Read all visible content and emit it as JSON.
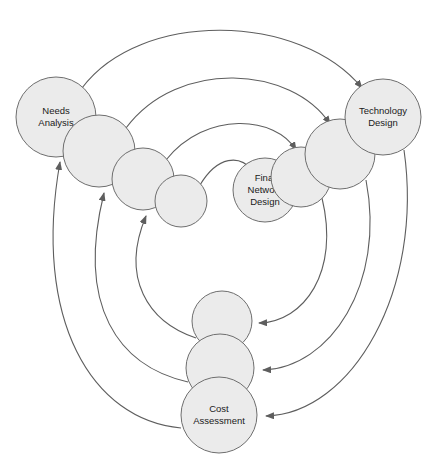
{
  "diagram": {
    "type": "cyclic-process-diagram",
    "background_color": "#ffffff",
    "node_fill_color": "#ebebeb",
    "node_stroke_color": "#6e6e6e",
    "arc_stroke_color": "#5e5e5e",
    "label_color": "#1a1a1a",
    "nodes": [
      {
        "id": "needs-analysis",
        "label": "Needs\nAnalysis",
        "lines": [
          "Needs",
          "Analysis"
        ],
        "cx": 56,
        "cy": 117,
        "r": 40,
        "labeled": true
      },
      {
        "id": "left-chain-2",
        "label": "",
        "lines": [],
        "cx": 99,
        "cy": 151,
        "r": 36,
        "labeled": false
      },
      {
        "id": "left-chain-3",
        "label": "",
        "lines": [],
        "cx": 143,
        "cy": 179,
        "r": 31,
        "labeled": false
      },
      {
        "id": "left-chain-4",
        "label": "",
        "lines": [],
        "cx": 181,
        "cy": 201,
        "r": 26,
        "labeled": false
      },
      {
        "id": "final-network-design",
        "label": "Final\nNetwork\nDesign",
        "lines": [
          "Final",
          "Network",
          "Design"
        ],
        "cx": 265,
        "cy": 190,
        "r": 32,
        "labeled": true
      },
      {
        "id": "right-chain-2",
        "label": "",
        "lines": [],
        "cx": 301,
        "cy": 177,
        "r": 30,
        "labeled": false
      },
      {
        "id": "right-chain-3",
        "label": "",
        "lines": [],
        "cx": 340,
        "cy": 154,
        "r": 35,
        "labeled": false
      },
      {
        "id": "technology-design",
        "label": "Technology\nDesign",
        "lines": [
          "Technology",
          "Design"
        ],
        "cx": 383,
        "cy": 117,
        "r": 38,
        "labeled": true
      },
      {
        "id": "bottom-chain-1",
        "label": "",
        "lines": [],
        "cx": 222,
        "cy": 321,
        "r": 30,
        "labeled": false
      },
      {
        "id": "bottom-chain-2",
        "label": "",
        "lines": [],
        "cx": 220,
        "cy": 368,
        "r": 34,
        "labeled": false
      },
      {
        "id": "cost-assessment",
        "label": "Cost\nAssessment",
        "lines": [
          "Cost",
          "Assessment"
        ],
        "cx": 219,
        "cy": 415,
        "r": 38,
        "labeled": true
      }
    ],
    "arcs": [
      {
        "id": "arc-needs-to-technology-outer",
        "from": "needs-analysis",
        "to": "technology-design",
        "direction": "left-to-right-over-top",
        "path": "M 82 88 C 140 10 300 12 362 88"
      },
      {
        "id": "arc-left2-to-techchain3",
        "from": "left-chain-2",
        "to": "right-chain-3",
        "direction": "left-to-right-over-top",
        "path": "M 126 128 C 178 58 292 66 330 124"
      },
      {
        "id": "arc-left3-to-rightchain2",
        "from": "left-chain-3",
        "to": "right-chain-2",
        "direction": "left-to-right-over-top",
        "path": "M 166 160 C 206 110 276 116 296 150"
      },
      {
        "id": "arc-left4-to-final",
        "from": "left-chain-4",
        "to": "final-network-design",
        "direction": "left-to-right-over-top",
        "path": "M 200 185 C 218 155 240 155 252 170"
      },
      {
        "id": "arc-technology-to-cost-outer",
        "from": "technology-design",
        "to": "cost-assessment",
        "direction": "right-to-bottom",
        "path": "M 404 150 C 424 290 352 414 266 416"
      },
      {
        "id": "arc-rightchain3-to-bottom2",
        "from": "right-chain-3",
        "to": "bottom-chain-2",
        "direction": "right-to-bottom",
        "path": "M 366 180 C 386 284 330 368 263 370"
      },
      {
        "id": "arc-rightchain2-to-bottom1",
        "from": "right-chain-2",
        "to": "bottom-chain-1",
        "direction": "right-to-bottom",
        "path": "M 322 198 C 340 272 304 322 259 323"
      },
      {
        "id": "arc-cost-to-needs-outer",
        "from": "cost-assessment",
        "to": "needs-analysis",
        "direction": "bottom-to-left",
        "path": "M 181 428 C 92 420 32 320 60 162"
      },
      {
        "id": "arc-bottom2-to-left2",
        "from": "bottom-chain-2",
        "to": "left-chain-2",
        "direction": "bottom-to-left",
        "path": "M 188 382 C 118 366 76 306 104 193"
      },
      {
        "id": "arc-bottom1-to-left3",
        "from": "bottom-chain-1",
        "to": "left-chain-3",
        "direction": "bottom-to-left",
        "path": "M 196 338 C 148 322 120 278 146 216"
      }
    ],
    "arrowhead": {
      "name": "arrowhead-marker",
      "shape": "triangle"
    }
  }
}
